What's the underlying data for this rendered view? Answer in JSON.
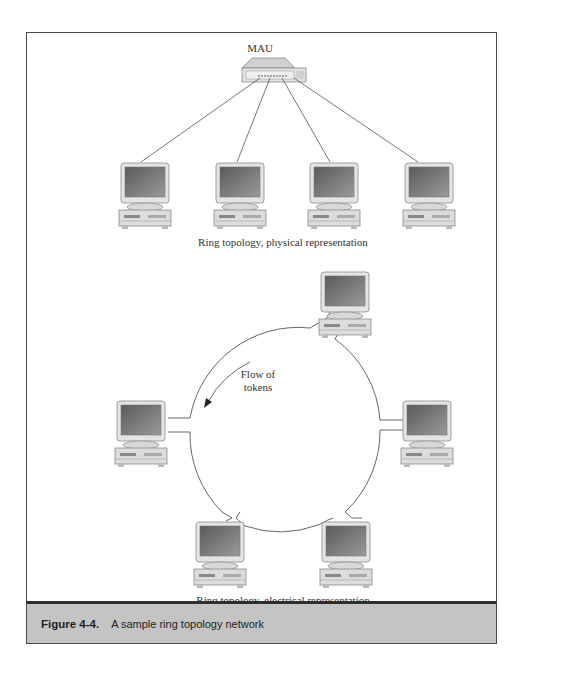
{
  "figure": {
    "label": "Figure 4-4.",
    "title": "A sample ring topology network"
  },
  "physical": {
    "hub_label": "MAU",
    "caption": "Ring topology, physical representation",
    "computers": 4
  },
  "electrical": {
    "caption": "Ring topology, electrical representation",
    "flow_label_line1": "Flow of",
    "flow_label_line2": "tokens",
    "computers": 5
  },
  "colors": {
    "frame_border": "#4a4a4a",
    "caption_bar": "#c4c4c4",
    "screen": "#6e6e6e"
  }
}
